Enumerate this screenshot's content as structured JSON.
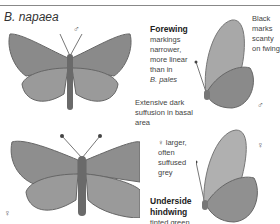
{
  "header": {
    "species_title": "B. napaea"
  },
  "symbols": {
    "male": "♂",
    "female": "♀"
  },
  "annotations": {
    "forewing_heading": "Forewing",
    "forewing_lines": [
      "markings",
      "narrower,",
      "more linear",
      "than in",
      "B. pales"
    ],
    "black_marks_lines": [
      "Black",
      "marks",
      "scanty",
      "on fwing"
    ],
    "suffusion_lines": [
      "Extensive dark",
      "suffusion in basal",
      "area"
    ],
    "female_lines": [
      "♀ larger,",
      "often",
      "suffused",
      "grey"
    ],
    "underside_heading_lines": [
      "Underside",
      "hindwing"
    ],
    "underside_text": "tinted green"
  },
  "colors": {
    "wing": "#8a8a8a",
    "wing_light": "#b5b5b5",
    "wing_dark": "#555555",
    "text": "#444444"
  }
}
